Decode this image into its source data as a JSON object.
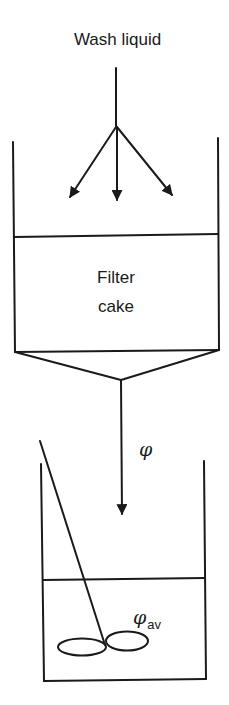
{
  "diagram": {
    "type": "process-schematic",
    "labels": {
      "wash_liquid": "Wash liquid",
      "filter_cake_line1": "Filter",
      "filter_cake_line2": "cake",
      "flow_concentration": "φ",
      "average_concentration_symbol": "φ",
      "average_concentration_subscript": "av"
    },
    "components": [
      "wash-liquid-inlet",
      "filter-vessel",
      "filter-cake",
      "funnel-outlet",
      "filtrate-stream",
      "collection-tank",
      "stirrer"
    ],
    "colors": {
      "stroke": "#1a1a1a",
      "background": "#ffffff"
    }
  }
}
